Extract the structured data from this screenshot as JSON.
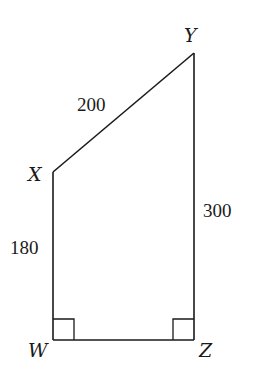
{
  "diagram": {
    "type": "quadrilateral",
    "vertices": [
      {
        "id": "W",
        "label": "W",
        "x": 53,
        "y": 340,
        "label_x": 28,
        "label_y": 357
      },
      {
        "id": "X",
        "label": "X",
        "x": 53,
        "y": 172,
        "label_x": 28,
        "label_y": 181
      },
      {
        "id": "Y",
        "label": "Y",
        "x": 194,
        "y": 53,
        "label_x": 184,
        "label_y": 42
      },
      {
        "id": "Z",
        "label": "Z",
        "x": 194,
        "y": 340,
        "label_x": 199,
        "label_y": 357
      }
    ],
    "edges": [
      {
        "from": "W",
        "to": "X",
        "length_label": "180",
        "label_x": 10,
        "label_y": 254
      },
      {
        "from": "X",
        "to": "Y",
        "length_label": "200",
        "label_x": 77,
        "label_y": 111
      },
      {
        "from": "Y",
        "to": "Z",
        "length_label": "300",
        "label_x": 203,
        "label_y": 217
      },
      {
        "from": "Z",
        "to": "W",
        "length_label": ""
      }
    ],
    "right_angles": [
      "W",
      "Z"
    ],
    "right_angle_size": 21
  }
}
